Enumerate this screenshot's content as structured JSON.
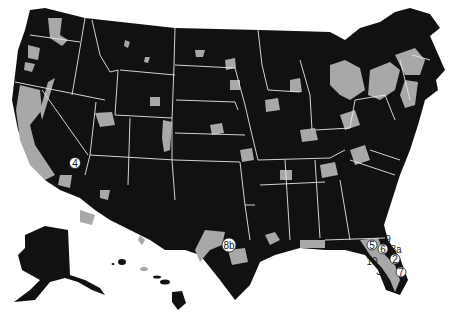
{
  "map": {
    "type": "choropleth",
    "region": "United States",
    "colors": {
      "background": "#ffffff",
      "primary_fill": "#111111",
      "secondary_fill": "#a8a8a8",
      "border": "#e8e8e8"
    },
    "insets": [
      "Alaska",
      "Hawaii"
    ]
  },
  "markers": [
    {
      "id": "4",
      "label": "4",
      "circled": true,
      "x": 75,
      "y": 163
    },
    {
      "id": "8b",
      "label": "8b",
      "circled": true,
      "x": 229,
      "y": 245
    },
    {
      "id": "9",
      "label": "9",
      "circled": false,
      "x": 388,
      "y": 240
    },
    {
      "id": "5",
      "label": "5",
      "circled": true,
      "x": 372,
      "y": 245
    },
    {
      "id": "6",
      "label": "6",
      "circled": true,
      "x": 383,
      "y": 249
    },
    {
      "id": "8a",
      "label": "8a",
      "circled": false,
      "x": 396,
      "y": 250
    },
    {
      "id": "2",
      "label": "2",
      "circled": true,
      "x": 395,
      "y": 259
    },
    {
      "id": "10",
      "label": "10",
      "circled": false,
      "x": 372,
      "y": 262
    },
    {
      "id": "3",
      "label": "3",
      "circled": false,
      "x": 379,
      "y": 272
    },
    {
      "id": "7",
      "label": "7",
      "circled": true,
      "x": 401,
      "y": 272
    },
    {
      "id": "1",
      "label": "1",
      "circled": false,
      "x": 386,
      "y": 279
    }
  ]
}
